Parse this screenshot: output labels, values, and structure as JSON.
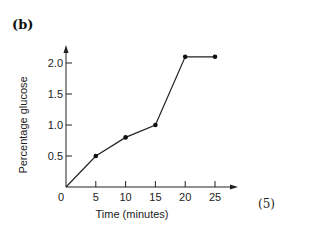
{
  "panel_label": "(b)",
  "marks_label": "(5)",
  "chart_data": {
    "type": "line",
    "title": "",
    "xlabel": "Time (minutes)",
    "ylabel": "Percentage glucose",
    "x": [
      0,
      5,
      10,
      15,
      20,
      25
    ],
    "series": [
      {
        "name": "glucose",
        "values": [
          0,
          0.5,
          0.8,
          1.0,
          2.1,
          2.1
        ]
      }
    ],
    "xlim": [
      0,
      25
    ],
    "ylim": [
      0,
      2.0
    ],
    "xticks": [
      0,
      5,
      10,
      15,
      20,
      25
    ],
    "xtick_labels": [
      "0",
      "5",
      "10",
      "15",
      "20",
      "25"
    ],
    "yticks": [
      0.5,
      1.0,
      1.5,
      2.0
    ],
    "ytick_labels": [
      "0.5",
      "1.0",
      "1.5",
      "2.0"
    ],
    "grid": false,
    "legend": "none",
    "markers": "filled-circle"
  }
}
